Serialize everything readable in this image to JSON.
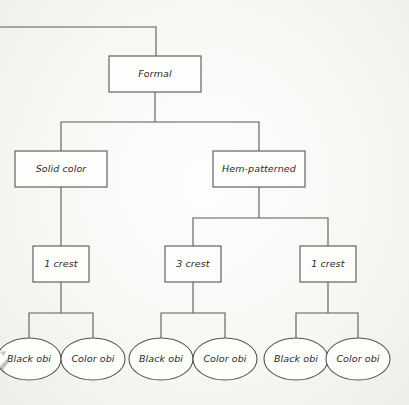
{
  "diagram": {
    "type": "tree",
    "title_visible": false,
    "canvas": {
      "width": 409,
      "height": 405
    },
    "colors": {
      "background": "#f7f6f3",
      "node_fill": "#fdfdfc",
      "stroke": "#555551",
      "text": "#2b2b2b"
    },
    "nodes": [
      {
        "id": "formal",
        "label": "Formal",
        "shape": "rect",
        "cx": 155,
        "cy": 74,
        "w": 92,
        "h": 36
      },
      {
        "id": "solid-color",
        "label": "Solid color",
        "shape": "rect",
        "cx": 61,
        "cy": 169,
        "w": 92,
        "h": 36
      },
      {
        "id": "hem-patterned",
        "label": "Hem-patterned",
        "shape": "rect",
        "cx": 259,
        "cy": 169,
        "w": 92,
        "h": 36
      },
      {
        "id": "crest-1-left",
        "label": "1 crest",
        "shape": "rect",
        "cx": 61,
        "cy": 264,
        "w": 56,
        "h": 36
      },
      {
        "id": "crest-3",
        "label": "3 crest",
        "shape": "rect",
        "cx": 193,
        "cy": 264,
        "w": 56,
        "h": 36
      },
      {
        "id": "crest-1-right",
        "label": "1 crest",
        "shape": "rect",
        "cx": 328,
        "cy": 264,
        "w": 56,
        "h": 36
      },
      {
        "id": "black-obi-1",
        "label": "Black obi",
        "shape": "ellipse",
        "cx": 29,
        "cy": 359,
        "w": 64,
        "h": 42
      },
      {
        "id": "color-obi-1",
        "label": "Color obi",
        "shape": "ellipse",
        "cx": 93,
        "cy": 359,
        "w": 64,
        "h": 42
      },
      {
        "id": "black-obi-2",
        "label": "Black obi",
        "shape": "ellipse",
        "cx": 161,
        "cy": 359,
        "w": 64,
        "h": 42
      },
      {
        "id": "color-obi-2",
        "label": "Color obi",
        "shape": "ellipse",
        "cx": 225,
        "cy": 359,
        "w": 64,
        "h": 42
      },
      {
        "id": "black-obi-3",
        "label": "Black obi",
        "shape": "ellipse",
        "cx": 296,
        "cy": 359,
        "w": 64,
        "h": 42
      },
      {
        "id": "color-obi-3",
        "label": "Color obi",
        "shape": "ellipse",
        "cx": 358,
        "cy": 359,
        "w": 64,
        "h": 42
      }
    ],
    "edges": [
      {
        "id": "edge-incoming-root",
        "from": "offscreen-parent",
        "to": "formal",
        "path": "M0,27 L156,27 L156,56"
      },
      {
        "id": "edge-formal-split",
        "from": "formal",
        "to": "level2",
        "path": "M155,92 L155,122 M61,122 L259,122 M61,122 L61,151 M259,122 L259,151"
      },
      {
        "id": "edge-solid-crest",
        "from": "solid-color",
        "to": "crest-1-left",
        "path": "M61,187 L61,246"
      },
      {
        "id": "edge-hem-split",
        "from": "hem-patterned",
        "to": "level3",
        "path": "M259,187 L259,218 M193,218 L328,218 M193,218 L193,246 M328,218 L328,246"
      },
      {
        "id": "edge-crest1l-split",
        "from": "crest-1-left",
        "to": "obi-group-1",
        "path": "M61,282 L61,313 M29,313 L93,313 M29,313 L29,338 M93,313 L93,338"
      },
      {
        "id": "edge-crest3-split",
        "from": "crest-3",
        "to": "obi-group-2",
        "path": "M193,282 L193,313 M161,313 L225,313 M161,313 L161,338 M225,313 L225,338"
      },
      {
        "id": "edge-crest1r-split",
        "from": "crest-1-right",
        "to": "obi-group-3",
        "path": "M328,282 L328,313 M296,313 L358,313 M296,313 L296,338 M358,313 L358,338"
      }
    ]
  }
}
